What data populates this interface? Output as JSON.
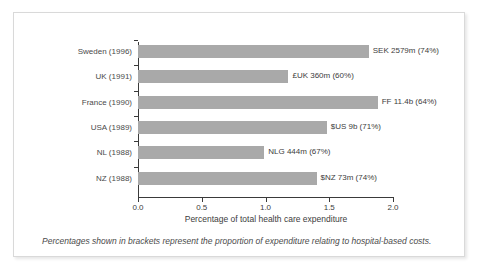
{
  "chart": {
    "type": "barh",
    "xlabel": "Percentage of total health care expenditure",
    "ylabel": "",
    "title": "",
    "footnote": "Percentages shown in brackets represent the proportion of expenditure relating to hospital-based costs.",
    "xlim": [
      0.0,
      2.0
    ],
    "xticks": [
      "0.0",
      "0.5",
      "1.0",
      "1.5",
      "2.0"
    ],
    "xtick_values": [
      0.0,
      0.5,
      1.0,
      1.5,
      2.0
    ],
    "grid": false,
    "legend": "none",
    "bar_color": "#a9a9a9",
    "axis_color": "#3a3a3a",
    "text_color": "#3d3d3d"
  },
  "chart_data": {
    "type": "bar",
    "orientation": "horizontal",
    "title": "",
    "xlabel": "Percentage of total health care expenditure",
    "ylabel": "",
    "xlim": [
      0.0,
      2.0
    ],
    "grid": false,
    "legend": "none",
    "categories": [
      "Sweden (1996)",
      "UK (1991)",
      "France (1990)",
      "USA (1989)",
      "NL (1988)",
      "NZ (1988)"
    ],
    "values": [
      1.81,
      1.18,
      1.88,
      1.48,
      0.99,
      1.4
    ],
    "annotations": [
      "SEK 2579m (74%)",
      "£UK 360m (60%)",
      "FF 11.4b (64%)",
      "$US 9b (71%)",
      "NLG 444m (67%)",
      "$NZ 73m (74%)"
    ],
    "footnote": "Percentages shown in brackets represent the proportion of expenditure relating to hospital-based costs."
  },
  "bars": [
    {
      "category": "Sweden (1996)",
      "value": 1.81,
      "label": "SEK 2579m (74%)"
    },
    {
      "category": "UK (1991)",
      "value": 1.18,
      "label": "£UK 360m (60%)"
    },
    {
      "category": "France (1990)",
      "value": 1.88,
      "label": "FF 11.4b (64%)"
    },
    {
      "category": "USA (1989)",
      "value": 1.48,
      "label": "$US 9b (71%)"
    },
    {
      "category": "NL (1988)",
      "value": 0.99,
      "label": "NLG 444m (67%)"
    },
    {
      "category": "NZ (1988)",
      "value": 1.4,
      "label": "$NZ 73m (74%)"
    }
  ]
}
